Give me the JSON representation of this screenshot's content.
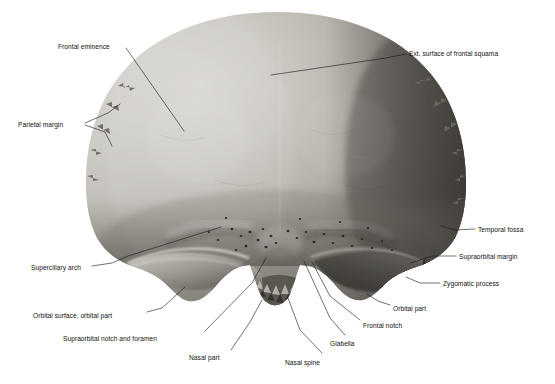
{
  "figure": {
    "background_color": "#ffffff",
    "ink_color": "#111111",
    "bone_tones": {
      "highlight": "#e8e6e1",
      "midtone": "#a9a59d",
      "shadow": "#4a4843",
      "deep_shadow": "#26241f"
    }
  },
  "labels": [
    {
      "id": "frontal-eminence",
      "text": "Frontal eminence",
      "x": 58,
      "y": 44,
      "align": "left"
    },
    {
      "id": "ext-surface-frontal-squama",
      "text": "Ext. surface of frontal squama",
      "x": 409,
      "y": 51,
      "align": "left"
    },
    {
      "id": "parietal-margin",
      "text": "Parietal margin",
      "x": 18,
      "y": 122,
      "align": "left"
    },
    {
      "id": "temporal-fossa",
      "text": "Temporal fossa",
      "x": 478,
      "y": 227,
      "align": "left"
    },
    {
      "id": "supraorbital-margin",
      "text": "Supraorbital margin",
      "x": 459,
      "y": 254,
      "align": "left"
    },
    {
      "id": "zygomatic-process",
      "text": "Zygomatic process",
      "x": 443,
      "y": 281,
      "align": "left"
    },
    {
      "id": "superciliary-arch",
      "text": "Superciliary arch",
      "x": 31,
      "y": 265,
      "align": "left"
    },
    {
      "id": "orbital-surface-orbital-part",
      "text": "Orbital surface, orbital part",
      "x": 33,
      "y": 313,
      "align": "left"
    },
    {
      "id": "supraorbital-notch-foramen",
      "text": "Supraorbital notch and foramen",
      "x": 63,
      "y": 336,
      "align": "left"
    },
    {
      "id": "orbital-part",
      "text": "Orbital part",
      "x": 393,
      "y": 306,
      "align": "left"
    },
    {
      "id": "frontal-notch",
      "text": "Frontal notch",
      "x": 363,
      "y": 323,
      "align": "left"
    },
    {
      "id": "glabella",
      "text": "Glabella",
      "x": 330,
      "y": 341,
      "align": "left"
    },
    {
      "id": "nasal-spine",
      "text": "Nasal spine",
      "x": 285,
      "y": 360,
      "align": "left"
    },
    {
      "id": "nasal-part",
      "text": "Nasal part",
      "x": 189,
      "y": 355,
      "align": "left"
    }
  ],
  "leaders": [
    {
      "id": "leader-frontal-eminence",
      "points": "126,48 184,131"
    },
    {
      "id": "leader-ext-surface",
      "points": "406,54 386,58 271,75"
    },
    {
      "id": "leader-parietal-margin-a",
      "points": "85,123 108,113 120,104"
    },
    {
      "id": "leader-parietal-margin-b",
      "points": "85,125 105,132 112,146"
    },
    {
      "id": "leader-temporal-fossa",
      "points": "475,229 455,230 441,226"
    },
    {
      "id": "leader-supraorbital-margin",
      "points": "456,256 432,256 411,263"
    },
    {
      "id": "leader-zygomatic-process",
      "points": "440,283 420,283 406,277"
    },
    {
      "id": "leader-superciliary-arch",
      "points": "92,266 112,263 128,256 221,227"
    },
    {
      "id": "leader-orbital-surface",
      "points": "147,312 162,308 185,287"
    },
    {
      "id": "leader-supraorbital-notch",
      "points": "205,331 252,283 266,258"
    },
    {
      "id": "leader-orbital-part",
      "points": "390,305 378,301 367,294"
    },
    {
      "id": "leader-frontal-notch",
      "points": "360,320 330,296 312,262"
    },
    {
      "id": "leader-glabella",
      "points": "345,335 330,318 304,261"
    },
    {
      "id": "leader-nasal-spine",
      "points": "322,353 300,330 288,298"
    },
    {
      "id": "leader-nasal-part",
      "points": "231,350 250,322 262,300"
    }
  ]
}
